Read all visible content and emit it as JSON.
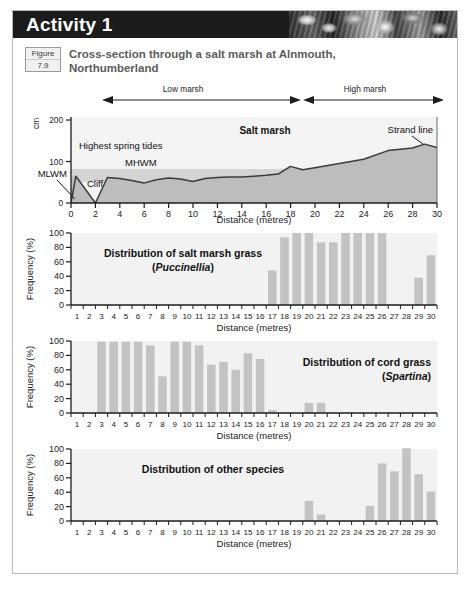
{
  "banner": {
    "title": "Activity 1",
    "photo_alt": "shingle-beach-photo-strip"
  },
  "figure": {
    "badge_word": "Figure",
    "badge_number": "7.9",
    "caption": "Cross-section through a salt marsh at Alnmouth, Northumberland"
  },
  "zones": {
    "low": "Low marsh",
    "high": "High marsh"
  },
  "cross_section": {
    "y_unit": "cm",
    "y_ticks": [
      "200",
      "100",
      "0"
    ],
    "x_title": "Distance (metres)",
    "x_ticks": [
      "0",
      "2",
      "4",
      "6",
      "8",
      "10",
      "12",
      "14",
      "16",
      "18",
      "20",
      "22",
      "24",
      "26",
      "28",
      "30"
    ],
    "annotations": {
      "salt_marsh": "Salt marsh",
      "strand_line": "Strand line",
      "highest_spring_tides": "Highest spring tides",
      "mhwm": "MHWM",
      "mlwm": "MLWM",
      "cliff": "Cliff"
    },
    "profile": [
      {
        "x": 0,
        "y": 0
      },
      {
        "x": 0.4,
        "y": 62
      },
      {
        "x": 2.0,
        "y": 0
      },
      {
        "x": 3.0,
        "y": 57
      },
      {
        "x": 4.0,
        "y": 55
      },
      {
        "x": 5.0,
        "y": 50
      },
      {
        "x": 6.0,
        "y": 44
      },
      {
        "x": 7.0,
        "y": 52
      },
      {
        "x": 8.0,
        "y": 56
      },
      {
        "x": 9.0,
        "y": 54
      },
      {
        "x": 10.0,
        "y": 48
      },
      {
        "x": 11.0,
        "y": 55
      },
      {
        "x": 12.0,
        "y": 57
      },
      {
        "x": 13.0,
        "y": 58
      },
      {
        "x": 14.0,
        "y": 58
      },
      {
        "x": 15.0,
        "y": 60
      },
      {
        "x": 16.0,
        "y": 62
      },
      {
        "x": 17.0,
        "y": 65
      },
      {
        "x": 18.0,
        "y": 83
      },
      {
        "x": 19.0,
        "y": 75
      },
      {
        "x": 20.0,
        "y": 80
      },
      {
        "x": 22.0,
        "y": 90
      },
      {
        "x": 24.0,
        "y": 100
      },
      {
        "x": 26.0,
        "y": 120
      },
      {
        "x": 28.0,
        "y": 126
      },
      {
        "x": 29.0,
        "y": 135
      },
      {
        "x": 30.0,
        "y": 127
      }
    ],
    "mhwm_level": 70,
    "mlwm_level": 50,
    "band_top": 70
  },
  "chart_data": [
    {
      "type": "bar",
      "id": "puccinellia",
      "title": "Distribution of salt marsh grass",
      "subtitle": "(Puccinellia)",
      "subtitle_italic": "Puccinellia",
      "title_position": "left",
      "xlabel": "Distance (metres)",
      "ylabel": "Frequency (%)",
      "ylim": [
        0,
        100
      ],
      "y_ticks": [
        "0",
        "20",
        "40",
        "60",
        "80",
        "100"
      ],
      "grid": false,
      "categories": [
        "1",
        "2",
        "3",
        "4",
        "5",
        "6",
        "7",
        "8",
        "9",
        "10",
        "11",
        "12",
        "13",
        "14",
        "15",
        "16",
        "17",
        "18",
        "19",
        "20",
        "21",
        "22",
        "23",
        "24",
        "25",
        "26",
        "27",
        "28",
        "29",
        "30"
      ],
      "values": [
        0,
        0,
        0,
        0,
        0,
        0,
        0,
        0,
        0,
        0,
        0,
        0,
        0,
        0,
        0,
        0,
        48,
        94,
        100,
        100,
        87,
        87,
        100,
        100,
        100,
        100,
        0,
        0,
        38,
        69
      ]
    },
    {
      "type": "bar",
      "id": "spartina",
      "title": "Distribution of cord grass",
      "subtitle": "(Spartina)",
      "subtitle_italic": "Spartina",
      "title_position": "right",
      "xlabel": "Distance (metres)",
      "ylabel": "Frequency (%)",
      "ylim": [
        0,
        100
      ],
      "y_ticks": [
        "0",
        "20",
        "40",
        "60",
        "80",
        "100"
      ],
      "grid": false,
      "categories": [
        "1",
        "2",
        "3",
        "4",
        "5",
        "6",
        "7",
        "8",
        "9",
        "10",
        "11",
        "12",
        "13",
        "14",
        "15",
        "16",
        "17",
        "18",
        "19",
        "20",
        "21",
        "22",
        "23",
        "24",
        "25",
        "26",
        "27",
        "28",
        "29",
        "30"
      ],
      "values": [
        0,
        0,
        99,
        99,
        99,
        99,
        94,
        51,
        99,
        99,
        94,
        67,
        71,
        60,
        83,
        75,
        4,
        0,
        0,
        14,
        14,
        0,
        0,
        0,
        0,
        0,
        0,
        0,
        0,
        0
      ]
    },
    {
      "type": "bar",
      "id": "other-species",
      "title": "Distribution of other species",
      "subtitle": "",
      "subtitle_italic": "",
      "title_position": "center-left",
      "xlabel": "Distance (metres)",
      "ylabel": "Frequency (%)",
      "ylim": [
        0,
        100
      ],
      "y_ticks": [
        "0",
        "20",
        "40",
        "60",
        "80",
        "100"
      ],
      "grid": false,
      "categories": [
        "1",
        "2",
        "3",
        "4",
        "5",
        "6",
        "7",
        "8",
        "9",
        "10",
        "11",
        "12",
        "13",
        "14",
        "15",
        "16",
        "17",
        "18",
        "19",
        "20",
        "21",
        "22",
        "23",
        "24",
        "25",
        "26",
        "27",
        "28",
        "29",
        "30"
      ],
      "values": [
        0,
        0,
        0,
        0,
        0,
        0,
        0,
        0,
        0,
        0,
        0,
        0,
        0,
        0,
        0,
        0,
        0,
        0,
        0,
        28,
        9,
        0,
        0,
        0,
        21,
        80,
        69,
        101,
        65,
        41
      ]
    }
  ],
  "colors": {
    "banner_bg": "#1b1b1b",
    "bar_fill": "#c3c3c3",
    "plot_bg": "#f2f2f2",
    "ground_fill": "#bdbdbd",
    "tide_band": "#d4d4d4",
    "sky_fill": "#f4f4f4",
    "caption_text": "#5b5b5b",
    "axis": "#1d1d1d"
  }
}
